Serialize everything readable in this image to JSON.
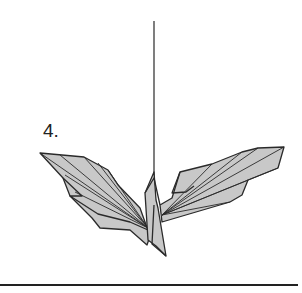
{
  "diagram": {
    "type": "origami-step",
    "step_label": "4.",
    "colors": {
      "fill": "#c8c8c8",
      "stroke": "#2a2a2a",
      "rule": "#222222",
      "background": "#ffffff"
    }
  }
}
